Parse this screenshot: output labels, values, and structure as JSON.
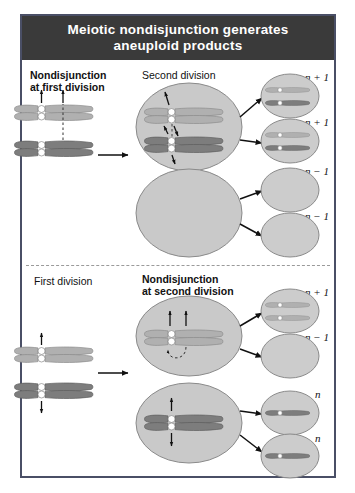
{
  "figure": {
    "title_line1": "Meiotic nondisjunction generates",
    "title_line2": "aneuploid products",
    "title_bar_color": "#3a3a3a",
    "frame_color": "#4a4f66",
    "background": "#ffffff",
    "width": 355,
    "height": 493
  },
  "colors": {
    "cell_fill": "#c9c9c9",
    "cell_stroke": "#8a8a8a",
    "gamete_fill": "#cccccc",
    "gamete_stroke": "#8a8a8a",
    "chromatid_light": "#b0b0b0",
    "chromatid_light_stroke": "#8d8d8d",
    "chromatid_dark": "#7d7d7d",
    "chromatid_dark_stroke": "#5f5f5f",
    "centromere": "#ffffff",
    "centromere_stroke": "#8a8a8a",
    "arrow": "#111111",
    "dashed_guide": "#333333",
    "divider": "#9a9a9a"
  },
  "panels": [
    {
      "id": "top-panel",
      "stage_labels": [
        {
          "id": "left-stage",
          "text": "Nondisjunction\nat first division",
          "bold": true,
          "x": 30,
          "y": 70
        },
        {
          "id": "mid-stage",
          "text": "Second division",
          "bold": false,
          "x": 142,
          "y": 70
        }
      ],
      "products": [
        {
          "id": "p1",
          "ploidy": "n + 1",
          "chromosomes": 2,
          "kinds": [
            "light",
            "dark"
          ]
        },
        {
          "id": "p2",
          "ploidy": "n + 1",
          "chromosomes": 2,
          "kinds": [
            "light",
            "dark"
          ]
        },
        {
          "id": "p3",
          "ploidy": "n − 1",
          "chromosomes": 0,
          "kinds": []
        },
        {
          "id": "p4",
          "ploidy": "n − 1",
          "chromosomes": 0,
          "kinds": []
        }
      ],
      "division_cells": [
        {
          "id": "top-cell-upper",
          "contents": "both homolog pairs",
          "chromosomes": 2
        },
        {
          "id": "top-cell-lower",
          "contents": "empty",
          "chromosomes": 0
        }
      ]
    },
    {
      "id": "bottom-panel",
      "stage_labels": [
        {
          "id": "left-stage",
          "text": "First division",
          "bold": false,
          "x": 34,
          "y": 276
        },
        {
          "id": "mid-stage",
          "text": "Nondisjunction\nat second division",
          "bold": true,
          "x": 142,
          "y": 274
        }
      ],
      "products": [
        {
          "id": "q1",
          "ploidy": "n + 1",
          "chromosomes": 2,
          "kinds": [
            "light",
            "light"
          ]
        },
        {
          "id": "q2",
          "ploidy": "n − 1",
          "chromosomes": 0,
          "kinds": []
        },
        {
          "id": "q3",
          "ploidy": "n",
          "chromosomes": 1,
          "kinds": [
            "dark"
          ]
        },
        {
          "id": "q4",
          "ploidy": "n",
          "chromosomes": 1,
          "kinds": [
            "dark"
          ]
        }
      ],
      "division_cells": [
        {
          "id": "bottom-cell-upper",
          "contents": "light homolog, nondisjoining",
          "chromosomes": 1
        },
        {
          "id": "bottom-cell-lower",
          "contents": "dark homolog, normal separation",
          "chromosomes": 1
        }
      ]
    }
  ],
  "ploidy_labels": [
    {
      "id": "lab-t1",
      "text": "n + 1",
      "x": 305,
      "y": 78
    },
    {
      "id": "lab-t2",
      "text": "n + 1",
      "x": 305,
      "y": 123
    },
    {
      "id": "lab-t3",
      "text": "n − 1",
      "x": 305,
      "y": 172
    },
    {
      "id": "lab-t4",
      "text": "n − 1",
      "x": 305,
      "y": 217
    },
    {
      "id": "lab-b1",
      "text": "n + 1",
      "x": 305,
      "y": 292
    },
    {
      "id": "lab-b2",
      "text": "n − 1",
      "x": 305,
      "y": 337
    },
    {
      "id": "lab-b3",
      "text": "n",
      "x": 313,
      "y": 394
    },
    {
      "id": "lab-b4",
      "text": "n",
      "x": 313,
      "y": 438
    }
  ]
}
